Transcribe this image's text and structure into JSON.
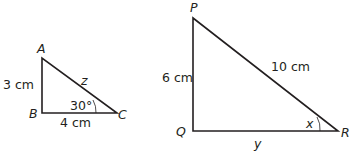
{
  "triangle_abc": {
    "vertices": {
      "A": "A",
      "B": "B",
      "C": "C"
    },
    "side_ab": "3 cm",
    "side_bc": "4 cm",
    "side_ac": "z",
    "angle_c": "30°"
  },
  "triangle_pqr": {
    "vertices": {
      "P": "P",
      "Q": "Q",
      "R": "R"
    },
    "side_pq": "6 cm",
    "side_pr": "10 cm",
    "side_qr": "y",
    "angle_r": "x"
  },
  "colors": {
    "stroke": "#231f20",
    "background": "#ffffff"
  }
}
